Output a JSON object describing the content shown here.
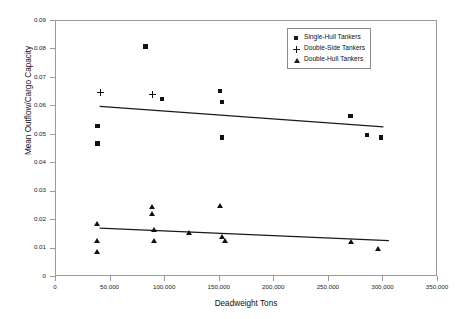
{
  "chart_data": {
    "type": "scatter",
    "title": "",
    "xlabel": "Deadweight Tons",
    "ylabel": "Mean Outflow/Cargo Capacity",
    "xlim": [
      0,
      350000
    ],
    "ylim": [
      0,
      0.09
    ],
    "grid": false,
    "legend_position": "top-right",
    "xticks": [
      "0",
      "50,000",
      "100,000",
      "150,000",
      "200,000",
      "250,000",
      "300,000",
      "350,000"
    ],
    "xtick_values": [
      0,
      50000,
      100000,
      150000,
      200000,
      250000,
      300000,
      350000
    ],
    "yticks": [
      "0",
      "0.01",
      "0.02",
      "0.03",
      "0.04",
      "0.05",
      "0.06",
      "0.07",
      "0.08",
      "0.09"
    ],
    "ytick_values": [
      0,
      0.01,
      0.02,
      0.03,
      0.04,
      0.05,
      0.06,
      0.07,
      0.08,
      0.09
    ],
    "series": [
      {
        "name": "Single-Hull Tankers",
        "marker": "square",
        "color": "#111111",
        "points": [
          {
            "x": 38000,
            "y": 0.053
          },
          {
            "x": 38000,
            "y": 0.047
          },
          {
            "x": 82000,
            "y": 0.081
          },
          {
            "x": 97000,
            "y": 0.0625
          },
          {
            "x": 150000,
            "y": 0.0655
          },
          {
            "x": 152000,
            "y": 0.0615
          },
          {
            "x": 152000,
            "y": 0.049
          },
          {
            "x": 270000,
            "y": 0.0565
          },
          {
            "x": 285000,
            "y": 0.05
          },
          {
            "x": 298000,
            "y": 0.049
          }
        ]
      },
      {
        "name": "Double-Side Tankers",
        "marker": "plus",
        "color": "#111111",
        "points": [
          {
            "x": 41000,
            "y": 0.065
          },
          {
            "x": 88000,
            "y": 0.0643
          }
        ]
      },
      {
        "name": "Double-Hull Tankers",
        "marker": "triangle",
        "color": "#111111",
        "points": [
          {
            "x": 38000,
            "y": 0.0188
          },
          {
            "x": 38000,
            "y": 0.0128
          },
          {
            "x": 38000,
            "y": 0.009
          },
          {
            "x": 88000,
            "y": 0.0248
          },
          {
            "x": 88000,
            "y": 0.0222
          },
          {
            "x": 90000,
            "y": 0.0168
          },
          {
            "x": 90000,
            "y": 0.013
          },
          {
            "x": 122000,
            "y": 0.0158
          },
          {
            "x": 150000,
            "y": 0.0253
          },
          {
            "x": 152000,
            "y": 0.0143
          },
          {
            "x": 155000,
            "y": 0.013
          },
          {
            "x": 270000,
            "y": 0.0125
          },
          {
            "x": 295000,
            "y": 0.01
          }
        ]
      }
    ],
    "trendlines": [
      {
        "for_series": "Single-Hull Tankers",
        "x_start": 40000,
        "y_start": 0.06,
        "x_end": 300000,
        "y_end": 0.0528
      },
      {
        "for_series": "Double-Hull Tankers",
        "x_start": 40000,
        "y_start": 0.0172,
        "x_end": 305000,
        "y_end": 0.0128
      }
    ]
  },
  "legend": {
    "items": [
      {
        "label": "Single-Hull Tankers",
        "marker": "square"
      },
      {
        "label": "Double-Side Tankers",
        "marker": "plus"
      },
      {
        "label": "Double-Hull Tankers",
        "marker": "triangle"
      }
    ]
  },
  "axes": {
    "x_title": "Deadweight Tons",
    "y_title": "Mean Outflow/Cargo Capacity"
  }
}
